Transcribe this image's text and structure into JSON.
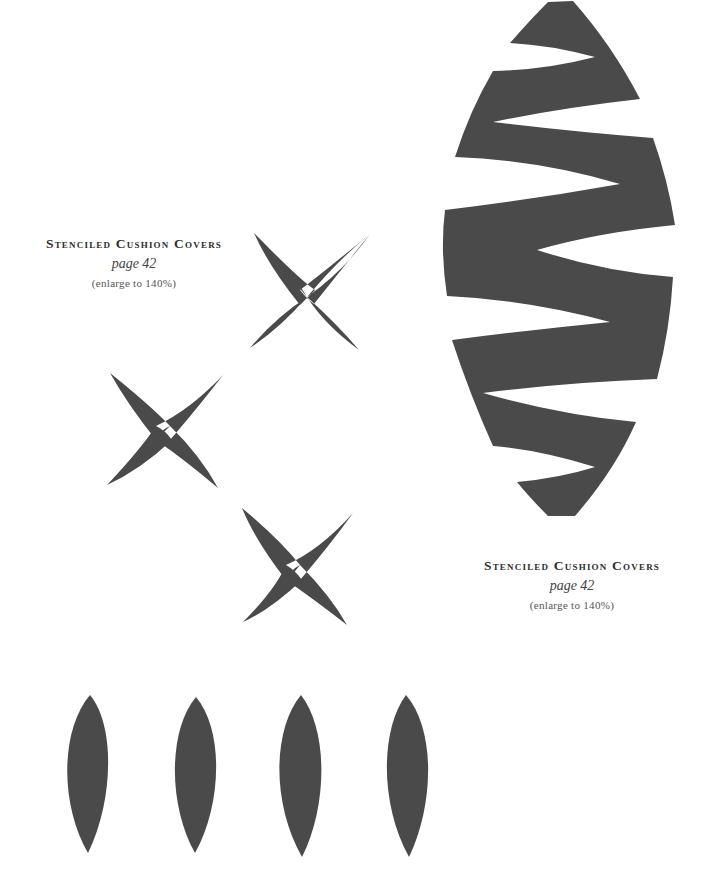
{
  "colors": {
    "stencil_fill": "#4a4a4a",
    "background": "#ffffff"
  },
  "captions": [
    {
      "title": "Stenciled Cushion Covers",
      "page": "page 42",
      "enlarge": "(enlarge to 140%)"
    },
    {
      "title": "Stenciled Cushion Covers",
      "page": "page 42",
      "enlarge": "(enlarge to 140%)"
    }
  ],
  "shapes": {
    "zigzag_oval": "zigzag-striped oval stencil",
    "crosses": [
      "cross stencil",
      "cross stencil",
      "cross stencil"
    ],
    "leaves": [
      "leaf stencil",
      "leaf stencil",
      "leaf stencil",
      "leaf stencil"
    ]
  }
}
